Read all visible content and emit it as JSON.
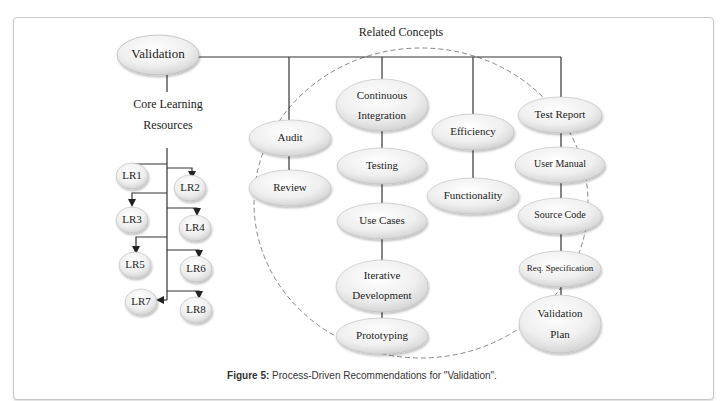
{
  "root": {
    "label": "Validation"
  },
  "core_learning": {
    "label_line1": "Core Learning",
    "label_line2": "Resources",
    "items": [
      "LR1",
      "LR2",
      "LR3",
      "LR4",
      "LR5",
      "LR6",
      "LR7",
      "LR8"
    ]
  },
  "related_concepts": {
    "label": "Related Concepts",
    "columns": [
      {
        "items": [
          {
            "lines": [
              "Audit"
            ]
          },
          {
            "lines": [
              "Review"
            ]
          }
        ]
      },
      {
        "items": [
          {
            "lines": [
              "Continuous",
              "Integration"
            ]
          },
          {
            "lines": [
              "Testing"
            ]
          },
          {
            "lines": [
              "Use Cases"
            ]
          },
          {
            "lines": [
              "Iterative",
              "Development"
            ]
          },
          {
            "lines": [
              "Prototyping"
            ]
          }
        ]
      },
      {
        "items": [
          {
            "lines": [
              "Efficiency"
            ]
          },
          {
            "lines": [
              "Functionality"
            ]
          }
        ]
      },
      {
        "items": [
          {
            "lines": [
              "Test Report"
            ]
          },
          {
            "lines": [
              "User Manual"
            ]
          },
          {
            "lines": [
              "Source Code"
            ]
          },
          {
            "lines": [
              "Req. Specification"
            ]
          },
          {
            "lines": [
              "Validation",
              "Plan"
            ]
          }
        ]
      }
    ]
  },
  "caption": {
    "prefix": "Figure 5:",
    "text": " Process-Driven Recommendations for \"Validation\"."
  },
  "colors": {
    "line": "#333333",
    "ellipse_fill_light": "#ffffff",
    "ellipse_fill_dark": "#d9d9d9",
    "dashed_circle": "#888888"
  }
}
